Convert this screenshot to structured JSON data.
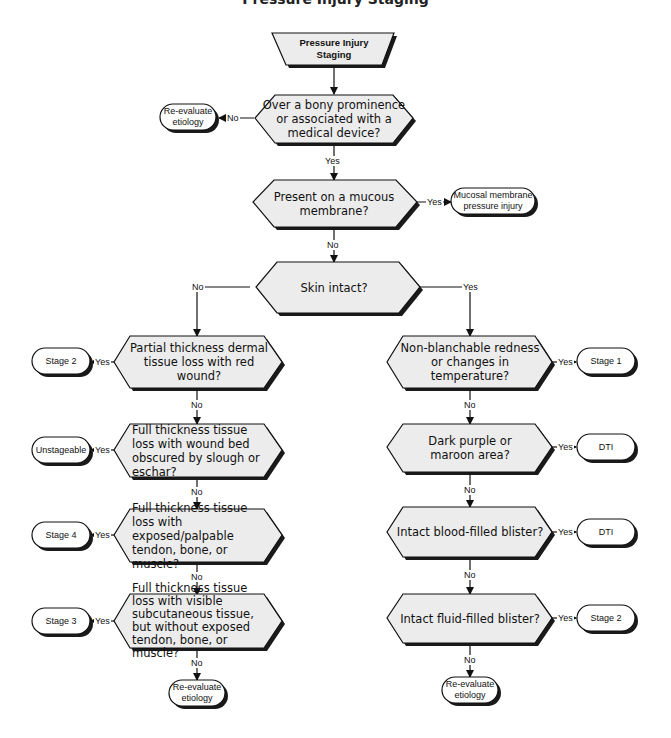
{
  "title": "Pressure Injury Staging",
  "colors": {
    "fill": "#ececec",
    "stroke": "#111111",
    "shadow": "#1a1a1a",
    "background": "#ffffff"
  },
  "start": {
    "label": "Pressure Injury Staging"
  },
  "decisions": {
    "bony": "Over a bony prominence or associated with a medical device?",
    "mucous": "Present on a mucous membrane?",
    "skin_intact": "Skin intact?",
    "partial": "Partial thickness dermal tissue loss with red wound?",
    "slough": "Full thickness tissue loss with wound bed obscured by slough or eschar?",
    "exposed": "Full thickness tissue loss with exposed/palpable tendon, bone, or muscle?",
    "subcut": "Full thickness tissue loss with visible subcutaneous tissue, but without exposed tendon, bone, or muscle?",
    "nonblanch": "Non-blanchable redness or changes in temperature?",
    "purple": "Dark purple or maroon area?",
    "blood": "Intact blood-filled blister?",
    "fluid": "Intact fluid-filled blister?"
  },
  "terminals": {
    "reeval_top": "Re-evaluate etiology",
    "mucosal": "Mucosal membrane pressure injury",
    "stage2_left": "Stage 2",
    "unstageable": "Unstageable",
    "stage4": "Stage 4",
    "stage3": "Stage 3",
    "reeval_left": "Re-evaluate etiology",
    "stage1": "Stage 1",
    "dti_1": "DTI",
    "dti_2": "DTI",
    "stage2_right": "Stage 2",
    "reeval_right": "Re-evaluate etiology"
  },
  "edge_labels": {
    "yes": "Yes",
    "no": "No"
  }
}
